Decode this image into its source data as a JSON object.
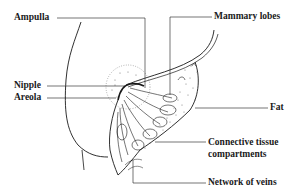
{
  "diagram": {
    "type": "anatomical-illustration",
    "labels": {
      "ampulla": "Ampulla",
      "mammary_lobes": "Mammary lobes",
      "nipple": "Nipple",
      "areola": "Areola",
      "fat": "Fat",
      "connective_line1": "Connective tissue",
      "connective_line2": "compartments",
      "veins": "Network of veins"
    },
    "colors": {
      "ink": "#1a1a1a",
      "stipple": "#555555",
      "background": "#ffffff"
    }
  }
}
